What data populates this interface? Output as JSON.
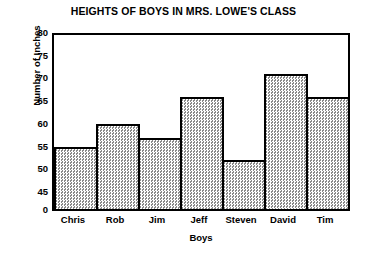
{
  "chart_data": {
    "type": "bar",
    "title": "HEIGHTS OF BOYS IN MRS. LOWE'S CLASS",
    "xlabel": "Boys",
    "ylabel": "Number of Inches",
    "categories": [
      "Chris",
      "Rob",
      "Jim",
      "Jeff",
      "Steven",
      "David",
      "Tim"
    ],
    "values": [
      55,
      60,
      57,
      66,
      52,
      71,
      66
    ],
    "series": [
      {
        "name": "Height in inches",
        "values": [
          55,
          60,
          57,
          66,
          52,
          71,
          66
        ]
      }
    ],
    "ylim": [
      45,
      80
    ],
    "y_axis_broken": true,
    "y_baseline_label": "0",
    "yticks": [
      45,
      50,
      55,
      60,
      65,
      70,
      75,
      80
    ],
    "ytick_labels": [
      "0",
      "45",
      "50",
      "55",
      "60",
      "65",
      "70",
      "75",
      "80"
    ],
    "grid": false,
    "legend": "none",
    "bar_fill_color": "#c9c9c9",
    "bar_edge_color": "#000000",
    "axis_color": "#000000",
    "background_color": "#ffffff"
  }
}
